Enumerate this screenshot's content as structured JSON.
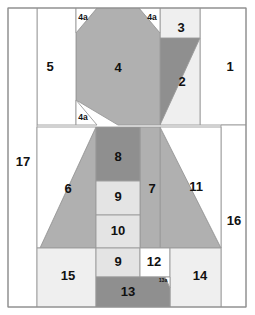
{
  "diagram": {
    "type": "quilt-block-piecing-diagram",
    "canvas": {
      "width": 255,
      "height": 315
    },
    "colors": {
      "background": "#ffffff",
      "white": "#ffffff",
      "light_gray": "#e4e4e4",
      "pale_gray": "#efefef",
      "medium_gray": "#b0b0b0",
      "dark_gray": "#8f8f8f",
      "outline": "#9a9a9a",
      "frame": "#8e8e8e",
      "label": "#111111"
    },
    "pieces": [
      {
        "id": "1",
        "label": "1",
        "shade": "white",
        "label_x": 230,
        "label_y": 68,
        "label_size": "main",
        "points": "200,8 246,8 246,125 200,125"
      },
      {
        "id": "3",
        "label": "3",
        "shade": "pale_gray",
        "label_x": 181,
        "label_y": 29,
        "label_size": "main",
        "points": "160,8 200,8 200,125 160,125"
      },
      {
        "id": "2",
        "label": "2",
        "shade": "dark_gray",
        "label_x": 182,
        "label_y": 83,
        "label_size": "main",
        "points": "160,38 200,38 160,125"
      },
      {
        "id": "4",
        "label": "4",
        "shade": "medium_gray",
        "label_x": 118,
        "label_y": 69,
        "label_size": "main",
        "points": "97,8 139,8 160,33 160,100 160,125 118,125 76,100 76,33"
      },
      {
        "id": "5",
        "label": "5",
        "shade": "white",
        "label_x": 50,
        "label_y": 68,
        "label_size": "main",
        "points": "37,8 76,8 76,125 37,125"
      },
      {
        "id": "4a-tl",
        "label": "4a",
        "shade": "white",
        "label_x": 83,
        "label_y": 18,
        "label_size": "sub",
        "points": "76,8 97,8 76,33"
      },
      {
        "id": "4a-tr",
        "label": "4a",
        "shade": "white",
        "label_x": 152,
        "label_y": 18,
        "label_size": "sub",
        "points": "139,8 160,8 160,33"
      },
      {
        "id": "4a-bl",
        "label": "4a",
        "shade": "white",
        "label_x": 83,
        "label_y": 118,
        "label_size": "sub",
        "points": "76,100 76,125 97,125"
      },
      {
        "id": "17",
        "label": "17",
        "shade": "white",
        "label_x": 23,
        "label_y": 163,
        "label_size": "main",
        "points": "8,8 37,8 37,307 8,307"
      },
      {
        "id": "16",
        "label": "16",
        "shade": "white",
        "label_x": 234,
        "label_y": 222,
        "label_size": "main",
        "points": "221,125 246,125 246,307 221,307"
      },
      {
        "id": "6",
        "label": "6",
        "shade": "medium_gray",
        "label_x": 68,
        "label_y": 190,
        "label_size": "main",
        "points": "96,127 96,248 40,248"
      },
      {
        "id": "6bg",
        "label": "",
        "shade": "white",
        "label_x": 0,
        "label_y": 0,
        "label_size": "main",
        "points": "37,127 96,127 40,248 37,248"
      },
      {
        "id": "11",
        "label": "11",
        "shade": "medium_gray",
        "label_x": 196,
        "label_y": 188,
        "label_size": "main",
        "points": "160,127 221,248 160,248"
      },
      {
        "id": "11bg",
        "label": "",
        "shade": "white",
        "label_x": 0,
        "label_y": 0,
        "label_size": "main",
        "points": "160,127 221,127 221,248"
      },
      {
        "id": "7",
        "label": "7",
        "shade": "medium_gray",
        "label_x": 152,
        "label_y": 190,
        "label_size": "main",
        "points": "140,127 160,127 160,248 140,248"
      },
      {
        "id": "8",
        "label": "8",
        "shade": "dark_gray",
        "label_x": 118,
        "label_y": 158,
        "label_size": "main",
        "points": "96,127 140,127 140,181 96,181"
      },
      {
        "id": "9a",
        "label": "9",
        "shade": "light_gray",
        "label_x": 118,
        "label_y": 198,
        "label_size": "main",
        "points": "96,181 140,181 140,215 96,215"
      },
      {
        "id": "10",
        "label": "10",
        "shade": "light_gray",
        "label_x": 118,
        "label_y": 232,
        "label_size": "main",
        "points": "96,215 140,215 140,248 96,248"
      },
      {
        "id": "15",
        "label": "15",
        "shade": "pale_gray",
        "label_x": 68,
        "label_y": 277,
        "label_size": "main",
        "points": "37,248 96,248 96,307 37,307"
      },
      {
        "id": "9b",
        "label": "9",
        "shade": "light_gray",
        "label_x": 118,
        "label_y": 263,
        "label_size": "main",
        "points": "96,248 140,248 140,277 96,277"
      },
      {
        "id": "12",
        "label": "12",
        "shade": "white",
        "label_x": 154,
        "label_y": 263,
        "label_size": "main",
        "points": "140,248 170,248 170,277 140,277"
      },
      {
        "id": "14",
        "label": "14",
        "shade": "pale_gray",
        "label_x": 200,
        "label_y": 277,
        "label_size": "main",
        "points": "170,248 221,248 221,307 170,307"
      },
      {
        "id": "13",
        "label": "13",
        "shade": "dark_gray",
        "label_x": 128,
        "label_y": 293,
        "label_size": "main",
        "points": "96,277 165,277 170,288 170,307 96,307"
      },
      {
        "id": "13a",
        "label": "13a",
        "shade": "white",
        "label_x": 163,
        "label_y": 281,
        "label_size": "tiny",
        "points": "165,277 170,277 170,288"
      }
    ],
    "frame": {
      "x": 8,
      "y": 8,
      "width": 238,
      "height": 299
    }
  }
}
